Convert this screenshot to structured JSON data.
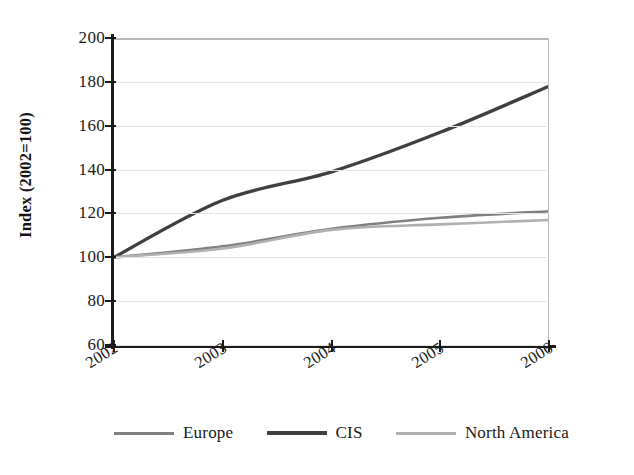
{
  "chart_data": {
    "type": "line",
    "title": "",
    "xlabel": "",
    "ylabel": "Index (2002=100)",
    "x": [
      2002,
      2003,
      2004,
      2005,
      2006
    ],
    "categories": [
      "2002",
      "2003",
      "2004",
      "2005",
      "2006"
    ],
    "xtick_labels": [
      "2002",
      "2003",
      "2004",
      "2005",
      "2006"
    ],
    "ytick_labels": [
      "200",
      "180",
      "160",
      "140",
      "120",
      "100",
      "80",
      "60"
    ],
    "ytick_values": [
      200,
      180,
      160,
      140,
      120,
      100,
      80,
      60
    ],
    "ylim": [
      60,
      200
    ],
    "xlim": [
      2002,
      2006
    ],
    "grid": true,
    "grid_axis": "y",
    "legend_position": "bottom",
    "series": [
      {
        "name": "Europe",
        "color": "#808080",
        "values": [
          100,
          105,
          113,
          118,
          121
        ]
      },
      {
        "name": "CIS",
        "color": "#3f3f3f",
        "values": [
          100,
          126,
          139,
          157,
          178
        ]
      },
      {
        "name": "North America",
        "color": "#b0b0b0",
        "values": [
          100,
          104,
          112.5,
          115,
          117
        ]
      }
    ]
  },
  "axes": {
    "ylabel": "Index (2002=100)",
    "yticks": [
      {
        "label": "200",
        "value": 200
      },
      {
        "label": "180",
        "value": 180
      },
      {
        "label": "160",
        "value": 160
      },
      {
        "label": "140",
        "value": 140
      },
      {
        "label": "120",
        "value": 120
      },
      {
        "label": "100",
        "value": 100
      },
      {
        "label": "80",
        "value": 80
      },
      {
        "label": "60",
        "value": 60
      }
    ],
    "xticks": [
      {
        "label": "2002",
        "value": 2002
      },
      {
        "label": "2003",
        "value": 2003
      },
      {
        "label": "2004",
        "value": 2004
      },
      {
        "label": "2005",
        "value": 2005
      },
      {
        "label": "2006",
        "value": 2006
      }
    ]
  },
  "legend": {
    "items": [
      {
        "label": "Europe",
        "color": "#808080",
        "width": 3
      },
      {
        "label": "CIS",
        "color": "#3f3f3f",
        "width": 4
      },
      {
        "label": "North America",
        "color": "#b0b0b0",
        "width": 3
      }
    ]
  },
  "colors": {
    "europe": "#808080",
    "cis": "#3f3f3f",
    "north_america": "#b0b0b0",
    "grid": "#e4e4e4",
    "axis": "#1b1b1b",
    "frame": "#b9b9b9",
    "background": "#ffffff"
  }
}
